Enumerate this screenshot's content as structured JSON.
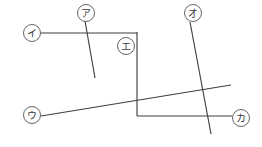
{
  "figure": {
    "background_color": "#ffffff",
    "line_color": "#3f3f3f",
    "label_text_color": "#3a3a3a",
    "label_circle_stroke": "#555555",
    "width": 262,
    "height": 147
  },
  "labels": [
    {
      "id": "a",
      "text": "ア",
      "romaji_name": "label-a",
      "cx": 86,
      "cy": 13,
      "r": 8.5,
      "describes": "short steep diagonal segment"
    },
    {
      "id": "i",
      "text": "イ",
      "romaji_name": "label-i",
      "cx": 32,
      "cy": 33,
      "r": 8.5,
      "describes": "upper horizontal segment"
    },
    {
      "id": "u",
      "text": "ウ",
      "romaji_name": "label-u",
      "cx": 32,
      "cy": 115,
      "r": 8.5,
      "describes": "long shallow rising diagonal segment"
    },
    {
      "id": "e",
      "text": "エ",
      "romaji_name": "label-e",
      "cx": 126,
      "cy": 46,
      "r": 8.5,
      "describes": "corner point of the bent polyline"
    },
    {
      "id": "o",
      "text": "オ",
      "romaji_name": "label-o",
      "cx": 193,
      "cy": 13,
      "r": 8.5,
      "describes": "long steep descending diagonal segment"
    },
    {
      "id": "ka",
      "text": "カ",
      "romaji_name": "label-ka",
      "cx": 241,
      "cy": 118,
      "r": 8.5,
      "describes": "lower horizontal segment"
    }
  ],
  "segments": [
    {
      "id": "seg-i-horizontal",
      "name": "upper-horizontal-line",
      "points": "41,33 137,33",
      "from_label": "i",
      "to_label": "e"
    },
    {
      "id": "seg-e-vertical",
      "name": "vertical-line",
      "points": "137,32 137,116",
      "from_label": "e",
      "to_label": "ka"
    },
    {
      "id": "seg-ka-horizontal",
      "name": "lower-horizontal-line",
      "points": "137,116 232,116",
      "from_label": "e",
      "to_label": "ka"
    },
    {
      "id": "seg-a-diagonal",
      "name": "short-steep-diagonal",
      "points": "85,21 95,78",
      "from_label": "a",
      "to_label": ""
    },
    {
      "id": "seg-o-diagonal",
      "name": "long-steep-diagonal",
      "points": "190,22 211,134",
      "from_label": "o",
      "to_label": ""
    },
    {
      "id": "seg-u-diagonal",
      "name": "long-shallow-diagonal",
      "points": "41,116 231,85",
      "from_label": "u",
      "to_label": ""
    }
  ]
}
